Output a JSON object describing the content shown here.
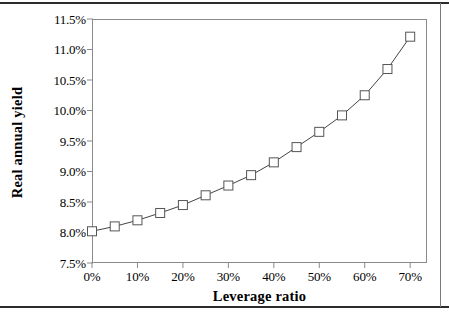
{
  "chart_data": {
    "type": "line",
    "title": "",
    "xlabel": "Leverage ratio",
    "ylabel": "Real annual yield",
    "xlim": [
      0,
      73.7
    ],
    "ylim": [
      7.5,
      11.5
    ],
    "grid": false,
    "legend": null,
    "marker": "open-square",
    "line_color": "#444444",
    "xticks": [
      "0%",
      "10%",
      "20%",
      "30%",
      "40%",
      "50%",
      "60%",
      "70%"
    ],
    "xtick_values": [
      0,
      10,
      20,
      30,
      40,
      50,
      60,
      70
    ],
    "yticks": [
      "7.5%",
      "8.0%",
      "8.5%",
      "9.0%",
      "9.5%",
      "10.0%",
      "10.5%",
      "11.0%",
      "11.5%"
    ],
    "ytick_values": [
      7.5,
      8.0,
      8.5,
      9.0,
      9.5,
      10.0,
      10.5,
      11.0,
      11.5
    ],
    "x": [
      0,
      5,
      10,
      15,
      20,
      25,
      30,
      35,
      40,
      45,
      50,
      55,
      60,
      65,
      70
    ],
    "values": [
      8.02,
      8.1,
      8.2,
      8.32,
      8.45,
      8.61,
      8.77,
      8.94,
      9.15,
      9.4,
      9.65,
      9.92,
      10.25,
      10.68,
      11.21
    ],
    "series": [
      {
        "name": "Real annual yield",
        "values": [
          8.02,
          8.1,
          8.2,
          8.32,
          8.45,
          8.61,
          8.77,
          8.94,
          9.15,
          9.4,
          9.65,
          9.92,
          10.25,
          10.68,
          11.21
        ]
      }
    ]
  }
}
